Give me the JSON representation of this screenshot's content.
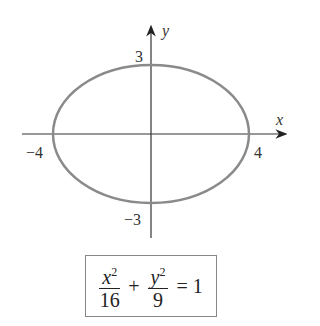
{
  "diagram": {
    "axes": {
      "x_label": "x",
      "y_label": "y"
    },
    "ticks": {
      "x_neg": "−4",
      "x_pos": "4",
      "y_pos": "3",
      "y_neg": "−3"
    },
    "ellipse": {
      "a": 4,
      "b": 3,
      "color": "#8a8a8a"
    },
    "equation": {
      "term1_num": "x",
      "term1_exp": "2",
      "term1_den": "16",
      "plus": "+",
      "term2_num": "y",
      "term2_exp": "2",
      "term2_den": "9",
      "equals": "= 1"
    }
  }
}
